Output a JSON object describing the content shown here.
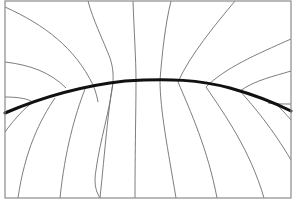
{
  "diagram": {
    "width": 296,
    "height": 203,
    "background": "#ffffff",
    "frame": {
      "x": 5,
      "y": 1,
      "width": 286,
      "height": 197,
      "stroke": "#8a8a8a",
      "stroke_width": 1.2
    },
    "thin_stroke": "#6e6e6e",
    "thin_width": 0.9,
    "thick_stroke": "#111111",
    "thick_width": 3,
    "thick_curve": "M5,113 C40,98 80,86 125,81 C170,78 200,80 230,88 C255,95 275,103 291,111",
    "thin_lines": [
      {
        "name": "field-line-left-1",
        "d": "M5,7 C45,25 75,48 93,85 C96,92 97,97 98,102"
      },
      {
        "name": "field-line-left-2",
        "d": "M5,62 C30,65 50,72 66,88"
      },
      {
        "name": "field-line-left-3",
        "d": "M5,97 C15,97 25,98 31,101"
      },
      {
        "name": "field-line-left-4",
        "d": "M5,132 C15,118 25,108 33,102"
      },
      {
        "name": "field-line-1",
        "d": "M88,1 C93,20 103,40 110,58 C114,70 113,78 113,82 C110,110 100,140 96,170 C94,182 95,190 100,198"
      },
      {
        "name": "field-line-2",
        "d": "M133,1 C134,30 136,60 136,80 C136,110 135,150 135,198"
      },
      {
        "name": "field-line-3",
        "d": "M171,1 C165,25 162,55 160,80 C160,110 168,150 176,198"
      },
      {
        "name": "field-line-4",
        "d": "M235,1 C215,25 190,55 178,82 C190,110 208,150 217,198"
      },
      {
        "name": "field-line-5",
        "d": "M291,39 C255,55 225,68 206,87 C225,115 250,150 264,198"
      },
      {
        "name": "field-line-6",
        "d": "M291,71 C275,76 255,80 240,91 C255,108 272,128 291,160"
      },
      {
        "name": "field-line-7",
        "d": "M291,104 C282,104 275,104 268,103"
      },
      {
        "name": "field-line-8",
        "d": "M291,120 C285,113 282,110 278,106"
      },
      {
        "name": "field-line-lower-1",
        "d": "M55,98 C40,120 25,150 18,198"
      },
      {
        "name": "field-line-lower-2",
        "d": "M85,89 C75,115 65,150 60,198"
      },
      {
        "name": "field-line-lower-3",
        "d": "M113,83 C108,110 105,150 100,198"
      }
    ]
  }
}
